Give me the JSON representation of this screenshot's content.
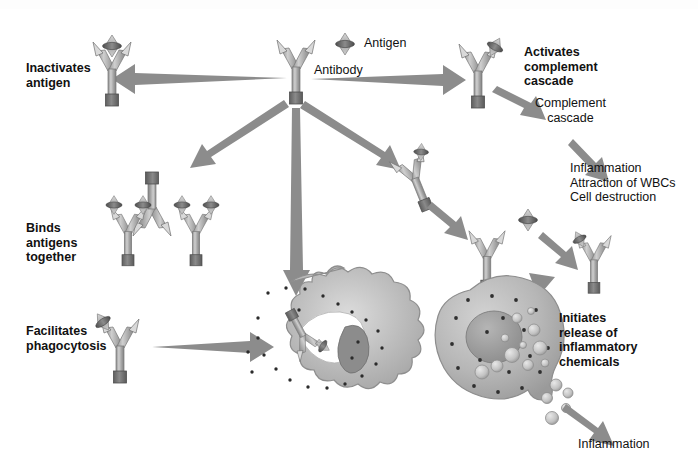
{
  "figure": {
    "background_color": "#ffffff"
  },
  "palette": {
    "antibody_arm": "#9a9a9a",
    "antibody_arm_light": "#c9c9c9",
    "antibody_base": "#6e6e6e",
    "antigen_body": "#bdbdbd",
    "antigen_band": "#5d5d5d",
    "arrow": "#8c8c8c",
    "cell_fill": "#b9b9b9",
    "cell_edge": "#8f8f8f",
    "nucleus": "#9d9d9d",
    "granule": "#cfcfcf",
    "text": "#141414"
  },
  "legend": {
    "antigen_label": "Antigen",
    "antibody_label": "Antibody"
  },
  "labels": {
    "inactivates_antigen": "Inactivates\nantigen",
    "binds_antigens_together": "Binds\nantigens\ntogether",
    "facilitates_phagocytosis": "Facilitates\nphagocytosis",
    "activates_complement_cascade": "Activates\ncomplement\ncascade",
    "complement_cascade": "Complement\ncascade",
    "cascade_effects": "Inflammation\nAttraction of WBCs\nCell destruction",
    "initiates_release": "Initiates\nrelease of\ninflammatory\nchemicals",
    "inflammation": "Inflammation"
  },
  "nodes": [
    {
      "id": "central-antibody",
      "name": "Antibody",
      "role": "source"
    },
    {
      "id": "inactivated-antigen-complex",
      "name": "Antibody bound to antigen",
      "role": "inactivates antigen"
    },
    {
      "id": "antigen-antibody-lattice",
      "name": "Cross-linked antibody lattice",
      "role": "binds antigens together"
    },
    {
      "id": "opsonizing-antibody",
      "name": "Antibody coating antigen",
      "role": "facilitates phagocytosis"
    },
    {
      "id": "phagocyte",
      "name": "Phagocyte",
      "role": "engulfs antibody-antigen complex"
    },
    {
      "id": "complement-antibody",
      "name": "Antibody activating complement",
      "role": "activates complement cascade"
    },
    {
      "id": "mast-cell",
      "name": "Mast cell",
      "role": "initiates release of inflammatory chemicals"
    }
  ],
  "flows": [
    {
      "from": "central-antibody",
      "to": "inactivates antigen"
    },
    {
      "from": "central-antibody",
      "to": "binds antigens together"
    },
    {
      "from": "central-antibody",
      "to": "facilitates phagocytosis"
    },
    {
      "from": "central-antibody",
      "to": "activates complement cascade"
    },
    {
      "from": "central-antibody",
      "to": "mast cell"
    },
    {
      "from": "activates complement cascade",
      "to": "complement cascade"
    },
    {
      "from": "complement cascade",
      "to": "inflammation / attraction of WBCs / cell destruction"
    },
    {
      "from": "mast cell",
      "to": "inflammation"
    }
  ]
}
